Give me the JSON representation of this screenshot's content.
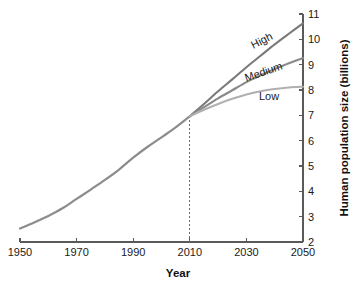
{
  "chart_data": {
    "type": "line",
    "title": "",
    "xlabel": "Year",
    "ylabel": "Human population size (billions)",
    "xlim": [
      1950,
      2050
    ],
    "ylim": [
      2,
      11
    ],
    "xticks": [
      1950,
      1970,
      1990,
      2010,
      2030,
      2050
    ],
    "xtick_labels": [
      "1950",
      "1970",
      "1990",
      "2010",
      "2030",
      "2050"
    ],
    "yticks": [
      2,
      3,
      4,
      5,
      6,
      7,
      8,
      9,
      10,
      11
    ],
    "ytick_labels": [
      "2",
      "3",
      "4",
      "5",
      "6",
      "7",
      "8",
      "9",
      "10",
      "11"
    ],
    "grid": false,
    "legend_position": "inline-end-labels",
    "y_axis_side": "right",
    "x": [
      1950,
      1955,
      1960,
      1965,
      1970,
      1975,
      1980,
      1985,
      1990,
      1995,
      2000,
      2005,
      2010,
      2015,
      2020,
      2025,
      2030,
      2035,
      2040,
      2045,
      2050
    ],
    "series": [
      {
        "name": "Historical",
        "label": "",
        "color": "#8c8c8c",
        "width": 2.2,
        "values": [
          2.53,
          2.77,
          3.03,
          3.33,
          3.7,
          4.07,
          4.45,
          4.86,
          5.33,
          5.75,
          6.13,
          6.52,
          6.96,
          null,
          null,
          null,
          null,
          null,
          null,
          null,
          null
        ]
      },
      {
        "name": "High",
        "label": "High",
        "color": "#7a7a7a",
        "width": 2.1,
        "values": [
          null,
          null,
          null,
          null,
          null,
          null,
          null,
          null,
          null,
          null,
          null,
          null,
          6.96,
          7.45,
          7.95,
          8.42,
          8.9,
          9.35,
          9.8,
          10.22,
          10.63
        ]
      },
      {
        "name": "Medium",
        "label": "Medium",
        "color": "#8a8a8a",
        "width": 2.1,
        "values": [
          null,
          null,
          null,
          null,
          null,
          null,
          null,
          null,
          null,
          null,
          null,
          null,
          6.96,
          7.32,
          7.67,
          7.99,
          8.31,
          8.58,
          8.83,
          9.06,
          9.26
        ]
      },
      {
        "name": "Low",
        "label": "Low",
        "color": "#b0b0b0",
        "width": 2.1,
        "values": [
          null,
          null,
          null,
          null,
          null,
          null,
          null,
          null,
          null,
          null,
          null,
          null,
          6.96,
          7.22,
          7.45,
          7.65,
          7.82,
          7.95,
          8.04,
          8.1,
          8.13
        ]
      }
    ],
    "annotations": [
      {
        "name": "present-day-marker",
        "type": "vline",
        "x": 2010,
        "y_top": 6.98,
        "y_bottom": 2,
        "style": "dashed"
      }
    ],
    "series_label_positions": [
      {
        "name": "High",
        "x": 2036,
        "y": 9.82,
        "rotate": -27
      },
      {
        "name": "Medium",
        "x": 2036.5,
        "y": 8.58,
        "rotate": -19
      },
      {
        "name": "Low",
        "x": 2038,
        "y": 7.62,
        "rotate": 0
      }
    ]
  }
}
